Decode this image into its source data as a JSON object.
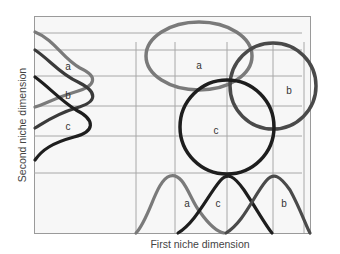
{
  "diagram": {
    "type": "niche-overlap",
    "x_axis_label": "First niche dimension",
    "y_axis_label": "Second niche dimension",
    "colors": {
      "frame_bg": "#f7f7f7",
      "frame_border": "#9a9a9a",
      "grid": "#a8a8a8",
      "species_a": "#7a7a7a",
      "species_b": "#4a4a4a",
      "species_c": "#1e1e1e"
    },
    "species": [
      {
        "id": "a",
        "label": "a"
      },
      {
        "id": "b",
        "label": "b"
      },
      {
        "id": "c",
        "label": "c"
      }
    ],
    "left_curve_labels": [
      "a",
      "b",
      "c"
    ],
    "bottom_curve_labels": [
      "a",
      "c",
      "b"
    ],
    "ellipse_labels": [
      "a",
      "c",
      "b"
    ]
  }
}
